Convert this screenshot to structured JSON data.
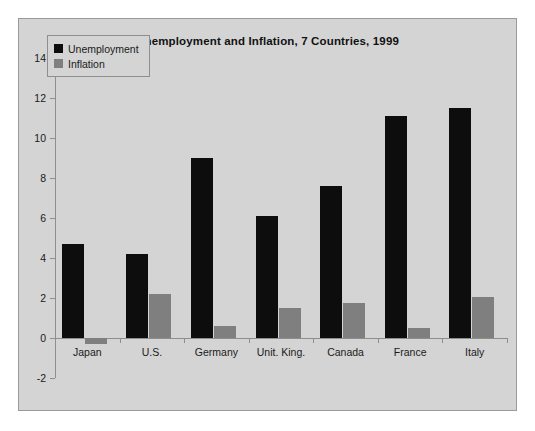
{
  "chart_data": {
    "type": "bar",
    "title": "Unemployment and Inflation, 7 Countries, 1999",
    "xlabel": "",
    "ylabel": "",
    "categories": [
      "Japan",
      "U.S.",
      "Germany",
      "Unit. King.",
      "Canada",
      "France",
      "Italy"
    ],
    "series": [
      {
        "name": "Unemployment",
        "color": "#0d0d0d",
        "values": [
          4.7,
          4.2,
          9.0,
          6.1,
          7.6,
          11.1,
          11.5
        ]
      },
      {
        "name": "Inflation",
        "color": "#7f7f7f",
        "values": [
          -0.3,
          2.2,
          0.6,
          1.5,
          1.75,
          0.5,
          2.05
        ]
      }
    ],
    "ylim": [
      -2,
      14
    ],
    "ytick_labels": [
      "14",
      "12",
      "10",
      "8",
      "6",
      "4",
      "2",
      "0",
      "-2"
    ],
    "ytick_values": [
      14,
      12,
      10,
      8,
      6,
      4,
      2,
      0,
      -2
    ],
    "grid": false,
    "legend_position": "top-left",
    "background_color": "#d4d4d4",
    "axis_color": "#8e8e8e"
  }
}
